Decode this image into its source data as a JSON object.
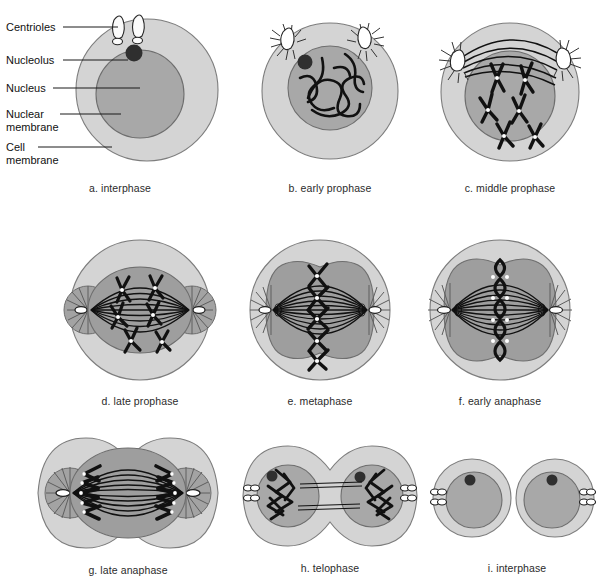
{
  "figure": {
    "palette": {
      "cytoplasm": "#d4d4d4",
      "cytoplasm_edge": "#8c8c8c",
      "nucleus": "#a8a8a8",
      "nucleus_edge": "#6e6e6e",
      "spindle_zone": "#9e9e9e",
      "aster": "#a0a0a0",
      "nucleolus": "#2f2f2f",
      "chromosome": "#111111",
      "centriole_fill": "#ffffff",
      "background": "#ffffff",
      "text": "#1a1a1a"
    }
  },
  "annotations": {
    "items": [
      {
        "label": "Centrioles",
        "line2": ""
      },
      {
        "label": "Nucleolus",
        "line2": ""
      },
      {
        "label": "Nucleus",
        "line2": ""
      },
      {
        "label": "Nuclear",
        "line2": "membrane"
      },
      {
        "label": "Cell",
        "line2": "membrane"
      }
    ]
  },
  "panels": [
    {
      "id": "a",
      "caption": "a. interphase",
      "stage": "interphase",
      "features": [
        "cell membrane",
        "nuclear membrane",
        "nucleus",
        "nucleolus",
        "centriole pair"
      ]
    },
    {
      "id": "b",
      "caption": "b. early prophase",
      "stage": "early-prophase",
      "features": [
        "chromatin threads",
        "nucleolus",
        "two asters",
        "nuclear membrane"
      ]
    },
    {
      "id": "c",
      "caption": "c. middle prophase",
      "stage": "middle-prophase",
      "features": [
        "condensed chromosomes",
        "centromeres",
        "spindle arcs",
        "separating asters"
      ]
    },
    {
      "id": "d",
      "caption": "d. late prophase",
      "stage": "late-prophase",
      "features": [
        "spindle apparatus",
        "polar asters",
        "scattered chromosomes"
      ]
    },
    {
      "id": "e",
      "caption": "e. metaphase",
      "stage": "metaphase",
      "features": [
        "equatorial plate",
        "aligned chromosomes",
        "full spindle"
      ]
    },
    {
      "id": "f",
      "caption": "f. early anaphase",
      "stage": "early-anaphase",
      "features": [
        "separating chromatids",
        "kinetochores",
        "spindle fibers"
      ]
    },
    {
      "id": "g",
      "caption": "g. late anaphase",
      "stage": "late-anaphase",
      "features": [
        "cleavage furrow",
        "chromosomes at poles",
        "elongated spindle"
      ]
    },
    {
      "id": "h",
      "caption": "h. telophase",
      "stage": "telophase",
      "features": [
        "two daughter nuclei",
        "decondensing chromosomes",
        "nucleoli",
        "residual fibers"
      ]
    },
    {
      "id": "i",
      "caption": "i. interphase",
      "stage": "interphase-daughters",
      "features": [
        "two daughter cells",
        "nucleus",
        "nucleolus",
        "centriole pairs"
      ]
    }
  ]
}
